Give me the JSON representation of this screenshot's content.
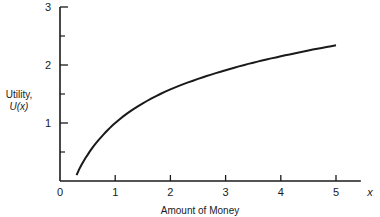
{
  "chart_data": {
    "type": "line",
    "title": "",
    "xlabel": "Amount of Money",
    "x_axis_symbol": "x",
    "ylabel_line1": "Utility,",
    "ylabel_line2": "U(x)",
    "xlim": [
      0,
      5.5
    ],
    "ylim": [
      0,
      3
    ],
    "x_ticks": [
      "0",
      "1",
      "2",
      "3",
      "4",
      "5"
    ],
    "y_ticks": [
      "1",
      "2",
      "3"
    ],
    "y_minor_ticks": [
      0.5,
      1.5,
      2.5
    ],
    "grid": false,
    "legend": null,
    "series": [
      {
        "name": "U(x)",
        "x": [
          0.3,
          0.5,
          0.75,
          1,
          1.5,
          2,
          2.5,
          3,
          3.5,
          4,
          4.5,
          5
        ],
        "values": [
          0.1,
          0.45,
          0.76,
          1.0,
          1.34,
          1.58,
          1.76,
          1.91,
          2.04,
          2.15,
          2.25,
          2.34
        ]
      }
    ],
    "colors": {
      "line": "#1a1a1a",
      "axis": "#1a1a1a",
      "background": "#ffffff"
    }
  }
}
